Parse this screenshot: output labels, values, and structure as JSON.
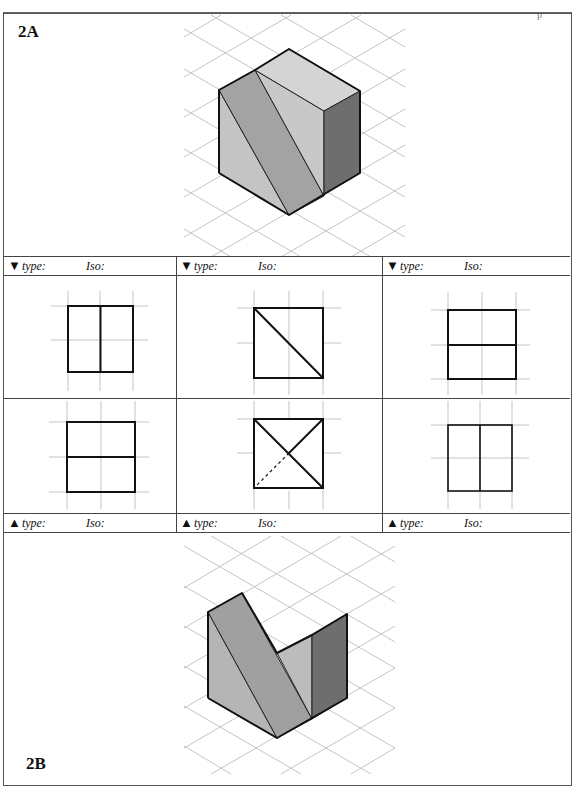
{
  "page": {
    "corner_mark": "p"
  },
  "panel_a": {
    "label": "2A",
    "figure": "isometric-block-with-slanted-cut"
  },
  "panel_b": {
    "label": "2B",
    "figure": "isometric-v-notch-block"
  },
  "top_header": [
    {
      "arrow": "▼",
      "type_label": "type:",
      "iso_label": "Iso:"
    },
    {
      "arrow": "▼",
      "type_label": "type:",
      "iso_label": "Iso:"
    },
    {
      "arrow": "▼",
      "type_label": "type:",
      "iso_label": "Iso:"
    }
  ],
  "bottom_header": [
    {
      "arrow": "▲",
      "type_label": "type:",
      "iso_label": "Iso:"
    },
    {
      "arrow": "▲",
      "type_label": "type:",
      "iso_label": "Iso:"
    },
    {
      "arrow": "▲",
      "type_label": "type:",
      "iso_label": "Iso:"
    }
  ],
  "views": {
    "row1": [
      "rect-vertical-split",
      "square-diagonal",
      "rect-horizontal-split"
    ],
    "row2": [
      "rect-horizontal-split",
      "square-x-with-hidden-line",
      "rect-vertical-split"
    ]
  },
  "colors": {
    "face_light": "#c4c4c4",
    "face_mid": "#a3a3a3",
    "face_top": "#d2d2d2",
    "face_dark": "#6e6e6e",
    "grid": "#bdbdbd",
    "edge": "#111111"
  }
}
